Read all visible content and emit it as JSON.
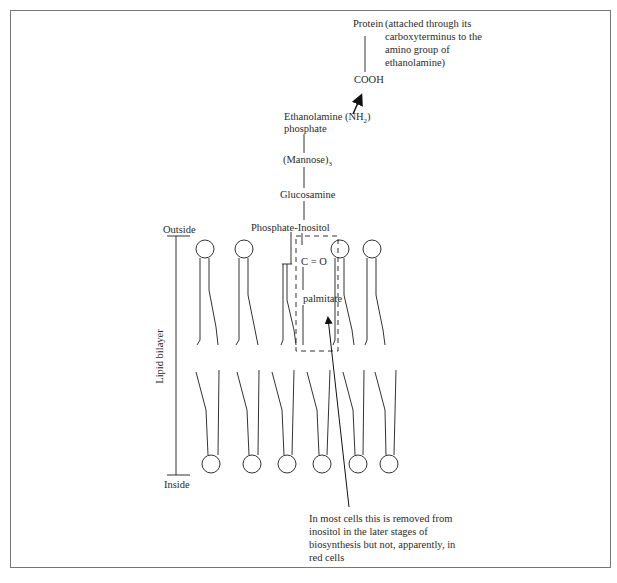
{
  "diagram": {
    "type": "GPI anchor in lipid bilayer",
    "labels": {
      "protein": "Protein",
      "protein_note": "(attached through its carboxyterminus to the amino group of ethanolamine)",
      "protein_note_lines": [
        "(attached through its",
        "carboxyterminus to the",
        "amino group of",
        "ethanolamine)"
      ],
      "cooh": "COOH",
      "ethanolamine": "Ethanolamine (NH",
      "ethanolamine_sub": "2",
      "ethanolamine_close": ")",
      "phosphate": "phosphate",
      "mannose": "(Mannose)",
      "mannose_sub": "3",
      "glucosamine": "Glucosamine",
      "phosphate_inositol": "Phosphate-Inositol",
      "c_equals_o": "C = O",
      "palmitate": "palmitate",
      "outside": "Outside",
      "inside": "Inside",
      "lipid_bilayer": "Lipid bilayer",
      "removal_note": "In most cells this is removed from inositol in the later stages of biosynthesis but not, apparently, in red cells",
      "removal_note_lines": [
        "In most cells this is removed from",
        "inositol in the later stages of",
        "biosynthesis but not, apparently, in",
        "red cells"
      ]
    },
    "lipids_upper_x": [
      205,
      244,
      286,
      340,
      381
    ],
    "lipids_lower_x": [
      211,
      252,
      287,
      321,
      358,
      389
    ],
    "colors": {
      "line": "#333333",
      "frame": "#777777",
      "text": "#2a2a2a"
    }
  }
}
